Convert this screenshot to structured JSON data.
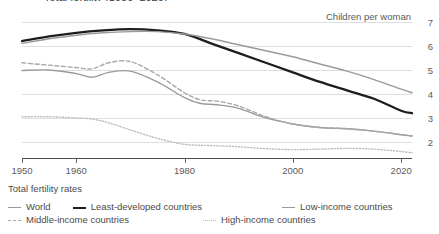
{
  "title_clipped": "Total fertility (1950–2020)",
  "chart_data": {
    "type": "line",
    "title": "",
    "subtitle": "",
    "xlabel": "",
    "ylabel": "Children per woman",
    "ylim": [
      1.33,
      7
    ],
    "xlim": [
      1950,
      2022
    ],
    "grid": true,
    "gridlines_y": [
      7,
      6,
      5,
      4,
      3,
      2
    ],
    "y_tick_labels": [
      "7",
      "6",
      "5",
      "4",
      "3",
      "2"
    ],
    "y_axis_side": "right",
    "x_tick_labels": [
      "1950",
      "1960",
      "1980",
      "2000",
      "2020"
    ],
    "x_ticks": [
      1950,
      1960,
      1980,
      2000,
      2020
    ],
    "legend_position": "below",
    "legend_title": "Total fertility rates",
    "series": [
      {
        "name": "World",
        "style": "solid",
        "color": "#9a9a9a",
        "width": 1.4,
        "x": [
          1950,
          1955,
          1960,
          1963,
          1966,
          1970,
          1975,
          1980,
          1983,
          1986,
          1990,
          1995,
          2000,
          2005,
          2010,
          2015,
          2020,
          2022
        ],
        "values": [
          4.98,
          5.0,
          4.85,
          4.7,
          4.9,
          4.95,
          4.5,
          3.85,
          3.6,
          3.55,
          3.4,
          3.0,
          2.75,
          2.6,
          2.55,
          2.45,
          2.3,
          2.25
        ]
      },
      {
        "name": "Least-developed countries",
        "style": "solid",
        "color": "#1d1d1d",
        "width": 2.3,
        "x": [
          1950,
          1955,
          1960,
          1965,
          1970,
          1975,
          1980,
          1985,
          1990,
          1995,
          2000,
          2005,
          2010,
          2015,
          2020,
          2022
        ],
        "values": [
          6.2,
          6.4,
          6.55,
          6.65,
          6.7,
          6.65,
          6.5,
          6.1,
          5.7,
          5.3,
          4.9,
          4.5,
          4.15,
          3.8,
          3.3,
          3.2
        ]
      },
      {
        "name": "Low-income countries",
        "style": "solid",
        "color": "#9a9a9a",
        "width": 1.4,
        "x": [
          1950,
          1955,
          1960,
          1965,
          1970,
          1975,
          1980,
          1985,
          1990,
          1995,
          2000,
          2005,
          2010,
          2015,
          2020,
          2022
        ],
        "values": [
          6.1,
          6.3,
          6.45,
          6.55,
          6.6,
          6.6,
          6.5,
          6.3,
          6.05,
          5.8,
          5.55,
          5.25,
          4.95,
          4.6,
          4.2,
          4.05
        ]
      },
      {
        "name": "Middle-income countries",
        "style": "dashed",
        "color": "#a8a8a8",
        "width": 1.4,
        "x": [
          1950,
          1955,
          1960,
          1963,
          1966,
          1970,
          1975,
          1980,
          1983,
          1986,
          1990,
          1995,
          2000,
          2005,
          2010,
          2015,
          2020,
          2022
        ],
        "values": [
          5.3,
          5.2,
          5.1,
          5.05,
          5.3,
          5.35,
          4.8,
          4.05,
          3.75,
          3.7,
          3.5,
          3.05,
          2.75,
          2.6,
          2.55,
          2.45,
          2.3,
          2.25
        ]
      },
      {
        "name": "High-income countries",
        "style": "dotted",
        "color": "#bdbdbd",
        "width": 1.4,
        "x": [
          1950,
          1955,
          1960,
          1963,
          1966,
          1970,
          1975,
          1980,
          1985,
          1990,
          1995,
          2000,
          2005,
          2010,
          2015,
          2020,
          2022
        ],
        "values": [
          3.05,
          3.05,
          3.0,
          2.95,
          2.8,
          2.5,
          2.15,
          1.9,
          1.85,
          1.8,
          1.72,
          1.68,
          1.7,
          1.73,
          1.7,
          1.6,
          1.55
        ]
      }
    ]
  },
  "axis": {
    "unit_label": "Children per woman"
  },
  "legend": {
    "title": "Total fertility rates",
    "rows": [
      [
        {
          "label": "World",
          "style": "solid-gray"
        },
        {
          "label": "Least-developed countries",
          "style": "solid-black"
        },
        {
          "label": "Low-income countries",
          "style": "solid-gray2"
        }
      ],
      [
        {
          "label": "Middle-income countries",
          "style": "dashed"
        },
        {
          "label": "High-income countries",
          "style": "dotted"
        }
      ]
    ]
  }
}
